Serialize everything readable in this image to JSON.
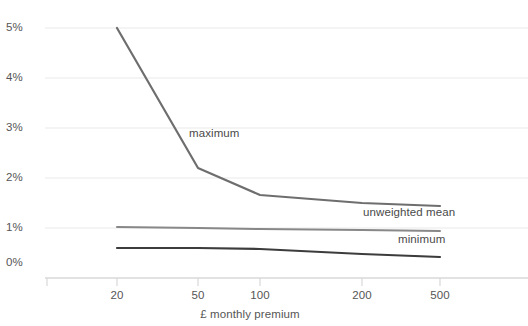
{
  "chart_data": {
    "type": "line",
    "title": "",
    "subtitle": "",
    "xlabel": "£ monthly premium",
    "ylabel": "",
    "x": [
      20,
      50,
      100,
      200,
      500
    ],
    "categories": [
      "20",
      "50",
      "100",
      "200",
      "500"
    ],
    "x_tick_labels": [
      "20",
      "50",
      "100",
      "200",
      "500"
    ],
    "y_tick_labels": [
      "0%",
      "1%",
      "2%",
      "3%",
      "4%",
      "5%"
    ],
    "ylim": [
      0,
      5
    ],
    "y_unit": "%",
    "grid": "horizontal",
    "legend_position": "inline-right-of-series",
    "series": [
      {
        "name": "maximum",
        "label": "maximum",
        "color": "#6e6e6e",
        "values": [
          5.0,
          2.2,
          1.66,
          1.5,
          1.44
        ]
      },
      {
        "name": "unweighted mean",
        "label": "unweighted mean",
        "color": "#888888",
        "values": [
          1.02,
          1.0,
          0.98,
          0.96,
          0.94
        ]
      },
      {
        "name": "minimum",
        "label": "minimum",
        "color": "#3c3c3c",
        "values": [
          0.6,
          0.6,
          0.58,
          0.48,
          0.42
        ]
      }
    ],
    "colors": {
      "gridline": "#e8e8e8",
      "axis": "#d6d6d6",
      "tick_text": "#555555",
      "label_text": "#4a4a4a",
      "background": "#ffffff"
    }
  },
  "axis": {
    "y_ticks": [
      {
        "label": "5%",
        "value": 5
      },
      {
        "label": "4%",
        "value": 4
      },
      {
        "label": "3%",
        "value": 3
      },
      {
        "label": "2%",
        "value": 2
      },
      {
        "label": "1%",
        "value": 1
      },
      {
        "label": "0%",
        "value": 0
      }
    ],
    "x_ticks": [
      {
        "label": "20",
        "value": 20
      },
      {
        "label": "50",
        "value": 50
      },
      {
        "label": "100",
        "value": 100
      },
      {
        "label": "200",
        "value": 200
      },
      {
        "label": "500",
        "value": 500
      }
    ],
    "x_axis_title": "£ monthly premium"
  },
  "annotations": {
    "maximum_label": "maximum",
    "mean_label": "unweighted mean",
    "minimum_label": "minimum"
  }
}
